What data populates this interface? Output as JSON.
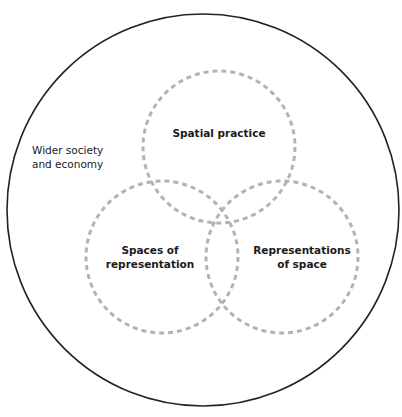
{
  "diagram": {
    "outer_circle": {
      "label": [
        "Wider society",
        "and economy"
      ],
      "cx": 203,
      "cy": 210,
      "r": 196,
      "stroke": "#222222",
      "stroke_width": 1.6
    },
    "circles": [
      {
        "id": "spatial-practice",
        "label": [
          "Spatial practice"
        ],
        "cx": 219,
        "cy": 147,
        "r": 76
      },
      {
        "id": "spaces-of-representation",
        "label": [
          "Spaces of",
          "representation"
        ],
        "cx": 162,
        "cy": 257,
        "r": 76
      },
      {
        "id": "representations-of-space",
        "label": [
          "Representations",
          "of space"
        ],
        "cx": 282,
        "cy": 257,
        "r": 76
      }
    ],
    "dashed_style": {
      "stroke": "#b3b3b3",
      "stroke_width": 3,
      "dasharray": "5 4"
    }
  }
}
